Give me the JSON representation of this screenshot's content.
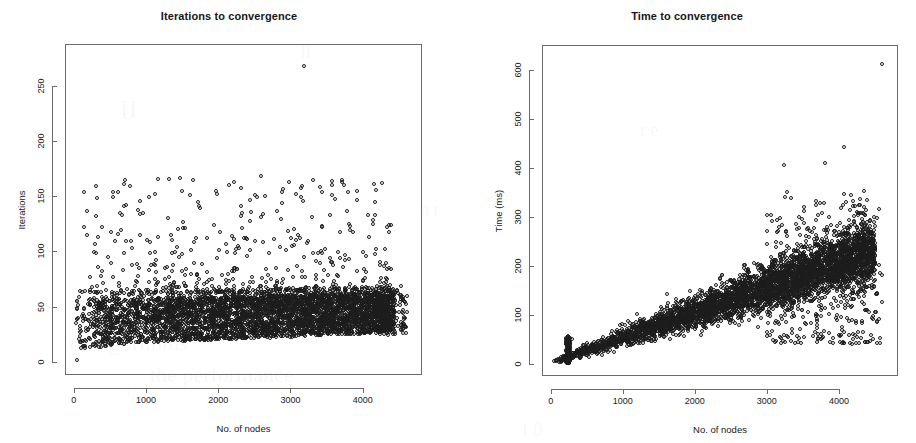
{
  "figure": {
    "background_color": "#ffffff",
    "point_color": "#1c1c1c",
    "axis_color": "#6b6b6b",
    "panels": 2
  },
  "bleed_through_text": [
    {
      "text": "of algorithms",
      "x": 70,
      "y": 330,
      "size": 22
    },
    {
      "text": "the performance",
      "x": 150,
      "y": 362,
      "size": 22
    },
    {
      "text": "II",
      "x": 120,
      "y": 95,
      "size": 26
    },
    {
      "text": "ll",
      "x": 300,
      "y": 40,
      "size": 20
    },
    {
      "text": "n  t",
      "x": 420,
      "y": 200,
      "size": 18
    },
    {
      "text": "r e",
      "x": 640,
      "y": 120,
      "size": 18
    },
    {
      "text": "s e",
      "x": 770,
      "y": 300,
      "size": 18
    },
    {
      "text": "1 0",
      "x": 520,
      "y": 420,
      "size": 18
    }
  ],
  "chart_data": [
    {
      "type": "scatter",
      "panel": "left",
      "title": "Iterations to convergence",
      "xlabel": "No. of nodes",
      "ylabel": "Iterations",
      "xlim": [
        -120,
        4820
      ],
      "ylim": [
        -12,
        288
      ],
      "xticks": [
        0,
        1000,
        2000,
        3000,
        4000
      ],
      "xticklabels": [
        "0",
        "1000",
        "2000",
        "3000",
        "4000"
      ],
      "yticks": [
        0,
        50,
        100,
        150,
        200,
        250
      ],
      "yticklabels": [
        "0",
        "50",
        "100",
        "150",
        "200",
        "250"
      ],
      "grid": false,
      "legend": null,
      "marker": "open-circle",
      "n_points_approx": 4600,
      "description": "Dense horizontal band of points between about 20 and 65 iterations across all node counts, rising slightly from ~15 near x=0, with a sparse upper scatter of outliers from 70 up to ~170 and one extreme outlier at about (3200, 268). Point cloud ends near x=4600.",
      "band": {
        "x_start": 20,
        "x_end": 4450,
        "y_low_start": 14,
        "y_low_end": 26,
        "y_high_start": 56,
        "y_high_end": 62
      },
      "outliers": [
        {
          "x": 3200,
          "y": 268
        },
        {
          "x": 150,
          "y": 153
        },
        {
          "x": 330,
          "y": 148
        },
        {
          "x": 700,
          "y": 161
        },
        {
          "x": 1480,
          "y": 166
        },
        {
          "x": 1660,
          "y": 164
        },
        {
          "x": 2600,
          "y": 168
        },
        {
          "x": 3580,
          "y": 160
        },
        {
          "x": 3440,
          "y": 153
        },
        {
          "x": 1130,
          "y": 152
        },
        {
          "x": 50,
          "y": 1
        }
      ]
    },
    {
      "type": "scatter",
      "panel": "right",
      "title": "Time to convergence",
      "xlabel": "No. of nodes",
      "ylabel": "Time (ms)",
      "xlim": [
        -120,
        4820
      ],
      "ylim": [
        -25,
        650
      ],
      "xticks": [
        0,
        1000,
        2000,
        3000,
        4000
      ],
      "xticklabels": [
        "0",
        "1000",
        "2000",
        "3000",
        "4000"
      ],
      "yticks": [
        0,
        100,
        200,
        300,
        400,
        500,
        600
      ],
      "yticklabels": [
        "0",
        "100",
        "200",
        "300",
        "400",
        "500",
        "600"
      ],
      "grid": false,
      "legend": null,
      "marker": "open-circle",
      "n_points_approx": 4600,
      "description": "Fan-shaped cloud growing roughly linearly with node count; mean time about 0 ms at x=0 rising to about 200 ms at x=4000, with spread widening from near zero to roughly 60-330 ms at the right edge. A narrow vertical spike of points reaching about 55 ms sits near x=250. A single far outlier at about (4600, 610).",
      "trend": {
        "slope_ms_per_node": 0.05,
        "intercept_ms": 0
      },
      "spike": {
        "x": 250,
        "y_max": 55
      },
      "outliers": [
        {
          "x": 4600,
          "y": 610
        },
        {
          "x": 4080,
          "y": 440
        },
        {
          "x": 3240,
          "y": 404
        },
        {
          "x": 3820,
          "y": 408
        },
        {
          "x": 3290,
          "y": 350
        },
        {
          "x": 1620,
          "y": 141
        }
      ]
    }
  ]
}
